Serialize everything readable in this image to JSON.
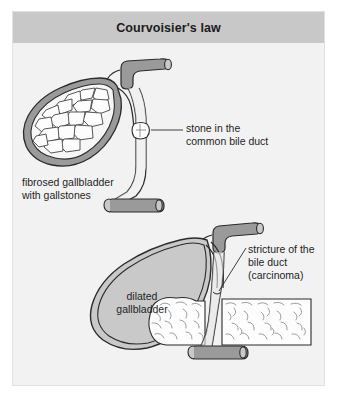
{
  "figure": {
    "title": "Courvoisier's law",
    "frame_bg": "#f2f2f2",
    "title_bg": "#c8c8c8",
    "ink": "#1e1e1e",
    "wall_fill": "#9a9a9a",
    "lumen_fill": "#c9c9c9",
    "stone_fill": "#fbfbfb",
    "tissue_fill": "#fdfdfd"
  },
  "labels": {
    "stone": "stone in the\ncommon bile duct",
    "fibrosed": "fibrosed gallbladder\nwith gallstones",
    "dilated": "dilated\ngallbladder",
    "stricture": "stricture of the\nbile duct\n(carcinoma)"
  },
  "panels": {
    "upper": {
      "name": "obstruction-by-stone",
      "organs": [
        "fibrosed gallbladder",
        "gallstones",
        "common bile duct",
        "hepatic duct",
        "duodenum stub",
        "impacted stone"
      ]
    },
    "lower": {
      "name": "obstruction-by-carcinoma",
      "organs": [
        "dilated gallbladder",
        "cystic duct",
        "hepatic duct",
        "common bile duct",
        "pancreas",
        "duodenum stub",
        "stricture"
      ]
    }
  }
}
